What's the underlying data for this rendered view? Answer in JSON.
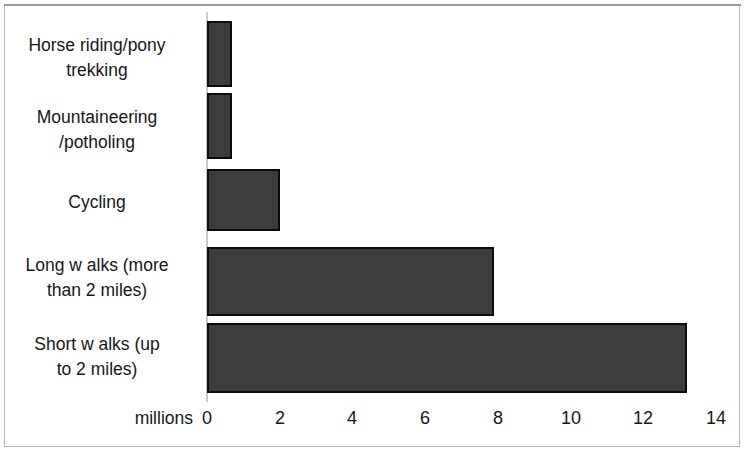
{
  "chart_data": {
    "type": "bar",
    "orientation": "horizontal",
    "title": "",
    "subtitle": "",
    "xlabel": "millions",
    "ylabel": "",
    "categories": [
      "Horse riding/pony trekking",
      "Mountaineering /potholing",
      "Cycling",
      "Long w alks (more than 2 miles)",
      "Short w alks (up to 2 miles)"
    ],
    "category_labels_wrapped": [
      "Horse riding/pony\ntrekking",
      "Mountaineering\n/potholing",
      "Cycling",
      "Long w alks (more\nthan 2 miles)",
      "Short w alks (up\nto 2 miles)"
    ],
    "values": [
      0.7,
      0.7,
      2.0,
      7.9,
      13.2
    ],
    "xlim": [
      0,
      14
    ],
    "xticks": [
      0,
      2,
      4,
      6,
      8,
      10,
      12,
      14
    ],
    "xtick_labels": [
      "0",
      "2",
      "4",
      "6",
      "8",
      "10",
      "12",
      "14"
    ],
    "grid": false,
    "legend": "none",
    "bar_fill_color": "#3d3d3d",
    "bar_border_color": "#0c0c0c",
    "axis_color": "#c9c9c9",
    "background_color": "#ffffff",
    "frame_color": "#b8b8b8"
  }
}
